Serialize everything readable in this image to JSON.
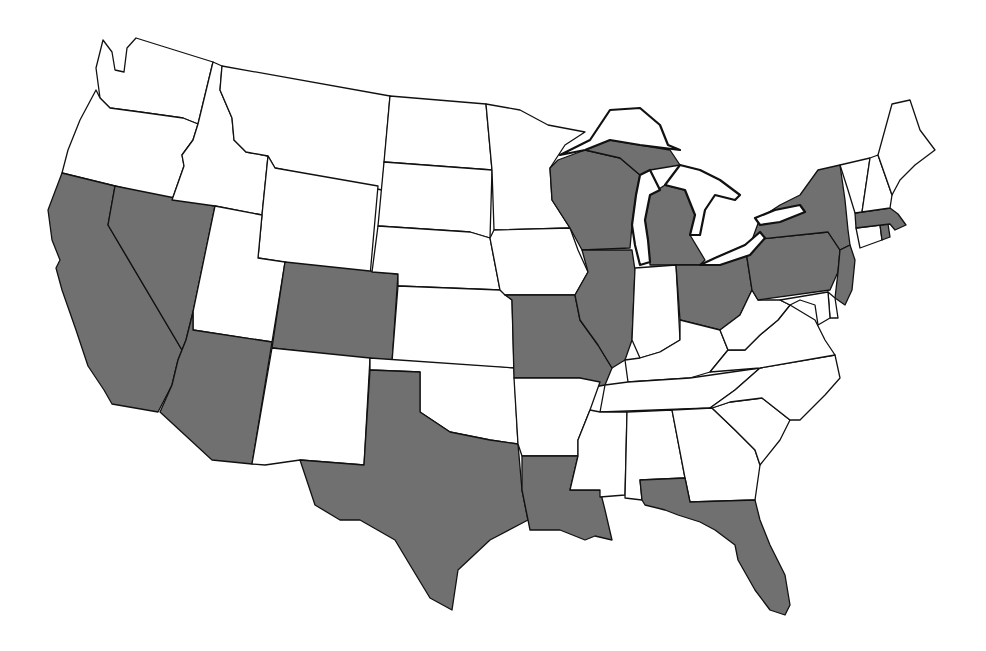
{
  "map": {
    "title": "",
    "region": "Contiguous United States",
    "colors": {
      "shaded": "#707070",
      "unshaded": "#ffffff",
      "border": "#111111",
      "background": "#ffffff"
    },
    "shaded_states": [
      "CA",
      "NV",
      "AZ",
      "CO",
      "TX",
      "LA",
      "MO",
      "IL",
      "WI",
      "MI",
      "OH",
      "PA",
      "NY",
      "NJ",
      "MA",
      "RI",
      "FL"
    ],
    "unshaded_states": [
      "WA",
      "OR",
      "ID",
      "MT",
      "WY",
      "UT",
      "NM",
      "ND",
      "SD",
      "NE",
      "KS",
      "OK",
      "MN",
      "IA",
      "AR",
      "MS",
      "AL",
      "GA",
      "SC",
      "NC",
      "TN",
      "KY",
      "IN",
      "WV",
      "VA",
      "MD",
      "DE",
      "CT",
      "VT",
      "NH",
      "ME"
    ],
    "states": [
      {
        "id": "WA",
        "name": "Washington",
        "shaded": false
      },
      {
        "id": "OR",
        "name": "Oregon",
        "shaded": false
      },
      {
        "id": "CA",
        "name": "California",
        "shaded": true
      },
      {
        "id": "NV",
        "name": "Nevada",
        "shaded": true
      },
      {
        "id": "ID",
        "name": "Idaho",
        "shaded": false
      },
      {
        "id": "MT",
        "name": "Montana",
        "shaded": false
      },
      {
        "id": "WY",
        "name": "Wyoming",
        "shaded": false
      },
      {
        "id": "UT",
        "name": "Utah",
        "shaded": false
      },
      {
        "id": "AZ",
        "name": "Arizona",
        "shaded": true
      },
      {
        "id": "CO",
        "name": "Colorado",
        "shaded": true
      },
      {
        "id": "NM",
        "name": "New Mexico",
        "shaded": false
      },
      {
        "id": "ND",
        "name": "North Dakota",
        "shaded": false
      },
      {
        "id": "SD",
        "name": "South Dakota",
        "shaded": false
      },
      {
        "id": "NE",
        "name": "Nebraska",
        "shaded": false
      },
      {
        "id": "KS",
        "name": "Kansas",
        "shaded": false
      },
      {
        "id": "OK",
        "name": "Oklahoma",
        "shaded": false
      },
      {
        "id": "TX",
        "name": "Texas",
        "shaded": true
      },
      {
        "id": "MN",
        "name": "Minnesota",
        "shaded": false
      },
      {
        "id": "IA",
        "name": "Iowa",
        "shaded": false
      },
      {
        "id": "MO",
        "name": "Missouri",
        "shaded": true
      },
      {
        "id": "AR",
        "name": "Arkansas",
        "shaded": false
      },
      {
        "id": "LA",
        "name": "Louisiana",
        "shaded": true
      },
      {
        "id": "WI",
        "name": "Wisconsin",
        "shaded": true
      },
      {
        "id": "IL",
        "name": "Illinois",
        "shaded": true
      },
      {
        "id": "MI",
        "name": "Michigan",
        "shaded": true
      },
      {
        "id": "IN",
        "name": "Indiana",
        "shaded": false
      },
      {
        "id": "OH",
        "name": "Ohio",
        "shaded": true
      },
      {
        "id": "KY",
        "name": "Kentucky",
        "shaded": false
      },
      {
        "id": "TN",
        "name": "Tennessee",
        "shaded": false
      },
      {
        "id": "MS",
        "name": "Mississippi",
        "shaded": false
      },
      {
        "id": "AL",
        "name": "Alabama",
        "shaded": false
      },
      {
        "id": "GA",
        "name": "Georgia",
        "shaded": false
      },
      {
        "id": "FL",
        "name": "Florida",
        "shaded": true
      },
      {
        "id": "SC",
        "name": "South Carolina",
        "shaded": false
      },
      {
        "id": "NC",
        "name": "North Carolina",
        "shaded": false
      },
      {
        "id": "VA",
        "name": "Virginia",
        "shaded": false
      },
      {
        "id": "WV",
        "name": "West Virginia",
        "shaded": false
      },
      {
        "id": "PA",
        "name": "Pennsylvania",
        "shaded": true
      },
      {
        "id": "NY",
        "name": "New York",
        "shaded": true
      },
      {
        "id": "NJ",
        "name": "New Jersey",
        "shaded": true
      },
      {
        "id": "DE",
        "name": "Delaware",
        "shaded": false
      },
      {
        "id": "MD",
        "name": "Maryland",
        "shaded": false
      },
      {
        "id": "CT",
        "name": "Connecticut",
        "shaded": false
      },
      {
        "id": "RI",
        "name": "Rhode Island",
        "shaded": true
      },
      {
        "id": "MA",
        "name": "Massachusetts",
        "shaded": true
      },
      {
        "id": "VT",
        "name": "Vermont",
        "shaded": false
      },
      {
        "id": "NH",
        "name": "New Hampshire",
        "shaded": false
      },
      {
        "id": "ME",
        "name": "Maine",
        "shaded": false
      }
    ]
  }
}
